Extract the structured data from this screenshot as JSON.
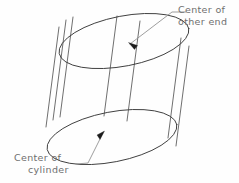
{
  "figure": {
    "subject": "cylinder",
    "background_color": "#fefefe",
    "line_color": "#3a3a3a",
    "leader_color": "#8c8c8c",
    "text_color": "#6e6e6e",
    "arrow_color": "#1c1c1c"
  },
  "annotations": {
    "other_end": {
      "name": "center-of-other-end",
      "line1": "Center  of",
      "line2": "other  end",
      "target_description": "center point of the top elliptical end face"
    },
    "cylinder": {
      "name": "center-of-cylinder",
      "line1": "Center  of",
      "line2": "cylinder",
      "target_description": "center point of the bottom elliptical face of the cylinder"
    }
  },
  "geometry": {
    "top_ellipse": {
      "center_x": 124,
      "center_y": 41,
      "radius_x": 66,
      "radius_y": 25,
      "rotation_deg": -11
    },
    "bottom_ellipse": {
      "center_x": 112,
      "center_y": 137,
      "radius_x": 66,
      "radius_y": 25,
      "rotation_deg": -11
    },
    "generator_line_count": 7,
    "arrow_top_tip": {
      "x": 128,
      "y": 42
    },
    "arrow_bottom_tip": {
      "x": 104,
      "y": 131
    }
  }
}
